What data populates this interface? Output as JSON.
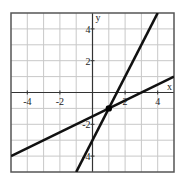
{
  "chart_data": {
    "type": "line",
    "title": "",
    "xlabel": "x",
    "ylabel": "y",
    "xlim": [
      -5,
      5
    ],
    "ylim": [
      -5,
      5
    ],
    "grid": true,
    "x_ticks": [
      "-4",
      "-2",
      "2",
      "4"
    ],
    "y_ticks": [
      "4",
      "2",
      "-2",
      "-4"
    ],
    "series": [
      {
        "name": "steep line",
        "equation": "y = 2x - 3",
        "points": [
          [
            -1,
            -5
          ],
          [
            4,
            5
          ]
        ]
      },
      {
        "name": "shallow line",
        "equation": "y = 0.5x - 1.5",
        "points": [
          [
            -5,
            -4
          ],
          [
            5,
            1
          ]
        ]
      }
    ],
    "annotations": [
      {
        "type": "point",
        "x": 1,
        "y": -1,
        "label": "intersection"
      }
    ]
  }
}
